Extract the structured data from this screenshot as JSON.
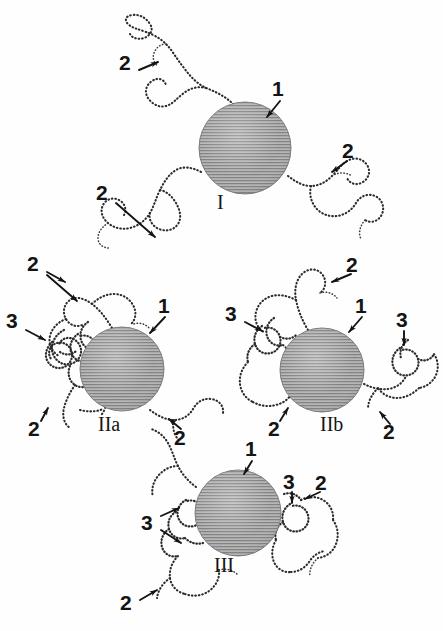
{
  "figure": {
    "background_color": "#fefefe",
    "ink_color": "#141414",
    "sphere_fill": "#a8a8a8",
    "sphere_hatch_color": "#6e6e6e",
    "chain_color": "#2b2b2b"
  },
  "legend_keys": {
    "key_1": "1",
    "key_2": "2",
    "key_3": "3",
    "meaning_1": "particle core (hatched sphere)",
    "meaning_2": "extended loop / tail chain segment",
    "meaning_3": "dense collapsed coil segment"
  },
  "structures": [
    {
      "id": "I",
      "caption": "I",
      "caption_x": 222,
      "caption_y": 201,
      "sphere": {
        "cx": 245,
        "cy": 148,
        "r": 46
      },
      "labels": [
        {
          "text": "1",
          "x": 278,
          "y": 86,
          "arrow": {
            "x1": 280,
            "y1": 101,
            "x2": 267,
            "y2": 117
          }
        },
        {
          "text": "2",
          "x": 125,
          "y": 60,
          "arrow": {
            "x1": 139,
            "y1": 70,
            "x2": 158,
            "y2": 62
          }
        },
        {
          "text": "2",
          "x": 102,
          "y": 190,
          "arrow": {
            "x1": 116,
            "y1": 203,
            "x2": 155,
            "y2": 237
          }
        },
        {
          "text": "2",
          "x": 348,
          "y": 148,
          "arrow": {
            "x1": 347,
            "y1": 161,
            "x2": 332,
            "y2": 172
          }
        }
      ]
    },
    {
      "id": "IIa",
      "caption": "IIa",
      "caption_x": 103,
      "caption_y": 423,
      "sphere": {
        "cx": 122,
        "cy": 369,
        "r": 42
      },
      "labels": [
        {
          "text": "1",
          "x": 164,
          "y": 303,
          "arrow": {
            "x1": 165,
            "y1": 317,
            "x2": 150,
            "y2": 333
          }
        },
        {
          "text": "2",
          "x": 33,
          "y": 261,
          "arrow": {
            "x1": 47,
            "y1": 272,
            "x2": 65,
            "y2": 282
          }
        },
        {
          "text": "2b",
          "x": 33,
          "y": 261,
          "arrow": {
            "x1": 47,
            "y1": 275,
            "x2": 77,
            "y2": 300
          }
        },
        {
          "text": "3",
          "x": 12,
          "y": 318,
          "arrow": {
            "x1": 26,
            "y1": 330,
            "x2": 45,
            "y2": 340
          }
        },
        {
          "text": "2",
          "x": 34,
          "y": 425,
          "arrow": {
            "x1": 40,
            "y1": 422,
            "x2": 47,
            "y2": 408
          }
        },
        {
          "text": "2",
          "x": 179,
          "y": 434,
          "arrow": {
            "x1": 180,
            "y1": 430,
            "x2": 168,
            "y2": 419
          }
        }
      ]
    },
    {
      "id": "IIb",
      "caption": "IIb",
      "caption_x": 325,
      "caption_y": 423,
      "sphere": {
        "cx": 322,
        "cy": 370,
        "r": 42
      },
      "labels": [
        {
          "text": "1",
          "x": 361,
          "y": 303,
          "arrow": {
            "x1": 362,
            "y1": 317,
            "x2": 349,
            "y2": 332
          }
        },
        {
          "text": "2",
          "x": 352,
          "y": 262,
          "arrow": {
            "x1": 350,
            "y1": 274,
            "x2": 331,
            "y2": 281
          }
        },
        {
          "text": "3",
          "x": 231,
          "y": 311,
          "arrow": {
            "x1": 245,
            "y1": 322,
            "x2": 262,
            "y2": 331
          }
        },
        {
          "text": "3",
          "x": 398,
          "y": 317,
          "arrow": {
            "x1": 403,
            "y1": 331,
            "x2": 403,
            "y2": 344
          }
        },
        {
          "text": "2",
          "x": 274,
          "y": 425,
          "arrow": {
            "x1": 279,
            "y1": 422,
            "x2": 287,
            "y2": 408
          }
        },
        {
          "text": "2",
          "x": 388,
          "y": 428,
          "arrow": {
            "x1": 389,
            "y1": 424,
            "x2": 379,
            "y2": 412
          }
        }
      ]
    },
    {
      "id": "III",
      "caption": "III",
      "caption_x": 219,
      "caption_y": 564,
      "sphere": {
        "cx": 238,
        "cy": 513,
        "r": 43
      },
      "labels": [
        {
          "text": "1",
          "x": 251,
          "y": 446,
          "arrow": {
            "x1": 252,
            "y1": 461,
            "x2": 244,
            "y2": 473
          }
        },
        {
          "text": "2",
          "x": 321,
          "y": 480,
          "arrow": {
            "x1": 320,
            "y1": 492,
            "x2": 304,
            "y2": 499
          }
        },
        {
          "text": "3",
          "x": 287,
          "y": 479,
          "arrow": {
            "x1": 291,
            "y1": 492,
            "x2": 291,
            "y2": 503
          }
        },
        {
          "text": "3",
          "x": 147,
          "y": 520,
          "arrow": {
            "x1": 161,
            "y1": 516,
            "x2": 178,
            "y2": 508
          }
        },
        {
          "text": "3b",
          "x": 147,
          "y": 520,
          "arrow": {
            "x1": 161,
            "y1": 530,
            "x2": 180,
            "y2": 543
          }
        },
        {
          "text": "2",
          "x": 126,
          "y": 600,
          "arrow": {
            "x1": 140,
            "y1": 600,
            "x2": 156,
            "y2": 590
          }
        }
      ]
    }
  ]
}
